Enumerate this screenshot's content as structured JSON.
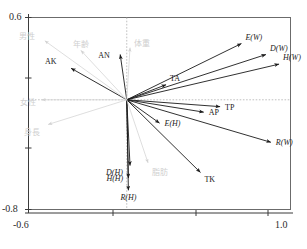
{
  "chart_data": {
    "type": "scatter",
    "subtype": "biplot-loading-vector-plot",
    "title": "",
    "xlabel": "",
    "ylabel": "",
    "xlim": [
      -0.6,
      1.0
    ],
    "ylim": [
      -0.8,
      0.6
    ],
    "grid": false,
    "zero_lines": "dotted",
    "legend": "none",
    "axis_ticks": {
      "x": [
        "-0.6",
        "1.0"
      ],
      "y": [
        "0.6",
        "-0.8"
      ]
    },
    "origin": [
      0.0,
      0.0
    ],
    "vectors": [
      {
        "label": "E(W)",
        "x": 0.7,
        "y": 0.41,
        "style": "dark",
        "italic": true,
        "label_pos": "above-right"
      },
      {
        "label": "D(W)",
        "x": 0.85,
        "y": 0.33,
        "style": "dark",
        "italic": true,
        "label_pos": "above-right"
      },
      {
        "label": "H(W)",
        "x": 0.93,
        "y": 0.26,
        "style": "dark",
        "italic": true,
        "label_pos": "above-right"
      },
      {
        "label": "TP",
        "x": 0.57,
        "y": -0.05,
        "style": "dark",
        "italic": false,
        "label_pos": "right"
      },
      {
        "label": "AP",
        "x": 0.47,
        "y": -0.09,
        "style": "dark",
        "italic": false,
        "label_pos": "right"
      },
      {
        "label": "R(W)",
        "x": 0.88,
        "y": -0.31,
        "style": "dark",
        "italic": true,
        "label_pos": "right"
      },
      {
        "label": "TK",
        "x": 0.45,
        "y": -0.53,
        "style": "dark",
        "italic": false,
        "label_pos": "below-right"
      },
      {
        "label": "E(H)",
        "x": 0.2,
        "y": -0.17,
        "style": "dark",
        "italic": true,
        "label_pos": "right"
      },
      {
        "label": "D(H)",
        "x": 0.02,
        "y": -0.48,
        "style": "dark",
        "italic": true,
        "label_pos": "below-left"
      },
      {
        "label": "H(H)",
        "x": 0.01,
        "y": -0.57,
        "style": "dark",
        "italic": true,
        "label_pos": "left"
      },
      {
        "label": "R(H)",
        "x": 0.01,
        "y": -0.66,
        "style": "dark",
        "italic": true,
        "label_pos": "below"
      },
      {
        "label": "AK",
        "x": -0.34,
        "y": 0.23,
        "style": "dark",
        "italic": false,
        "label_pos": "above-left"
      },
      {
        "label": "AN",
        "x": -0.04,
        "y": 0.33,
        "style": "dark",
        "italic": false,
        "label_pos": "left"
      },
      {
        "label": "TA",
        "x": 0.24,
        "y": 0.11,
        "style": "dark",
        "italic": false,
        "label_pos": "above-right"
      },
      {
        "label": "男性",
        "x": -0.5,
        "y": 0.43,
        "style": "faint",
        "italic": false,
        "label_pos": "above-left"
      },
      {
        "label": "年齢",
        "x": -0.28,
        "y": 0.36,
        "style": "faint",
        "italic": false,
        "label_pos": "above"
      },
      {
        "label": "体重",
        "x": 0.02,
        "y": 0.38,
        "style": "faint",
        "italic": false,
        "label_pos": "above-right"
      },
      {
        "label": "女性",
        "x": -0.52,
        "y": 0.0,
        "style": "faint",
        "italic": false,
        "label_pos": "left"
      },
      {
        "label": "身長",
        "x": -0.48,
        "y": -0.18,
        "style": "faint",
        "italic": false,
        "label_pos": "below-left"
      },
      {
        "label": "脂肪",
        "x": 0.13,
        "y": -0.46,
        "style": "faint",
        "italic": false,
        "label_pos": "below-right"
      }
    ]
  },
  "frame": {
    "y_max_label": "0.6",
    "y_min_label": "-0.8",
    "x_min_label": "-0.6",
    "x_max_label": "1.0"
  }
}
